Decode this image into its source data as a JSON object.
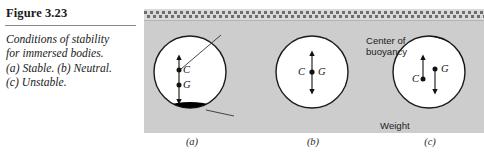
{
  "caption": {
    "figure_number": "Figure 3.23",
    "lines": [
      "Conditions of stability",
      "for immersed bodies.",
      "(a) Stable. (b) Neutral.",
      "(c) Unstable."
    ]
  },
  "figure": {
    "annotations": {
      "buoyancy_line1": "Center of",
      "buoyancy_line2": "buoyancy",
      "weight": "Weight"
    },
    "panels": [
      {
        "id": "a",
        "sub_label": "(a)",
        "condition": "Stable",
        "center_of_buoyancy_label": "C",
        "center_of_gravity_label": "G",
        "weight_position": "bottom"
      },
      {
        "id": "b",
        "sub_label": "(b)",
        "condition": "Neutral",
        "center_of_buoyancy_label": "C",
        "center_of_gravity_label": "G",
        "weight_position": "none"
      },
      {
        "id": "c",
        "sub_label": "(c)",
        "condition": "Unstable",
        "center_of_buoyancy_label": "C",
        "center_of_gravity_label": "G",
        "weight_position": "top-right"
      }
    ]
  },
  "colors": {
    "fluid": "#cdcdcd",
    "body_fill": "#ffffff",
    "weight_fill": "#000000",
    "outline": "#1a1a1a",
    "page_background": "#ffffff"
  }
}
